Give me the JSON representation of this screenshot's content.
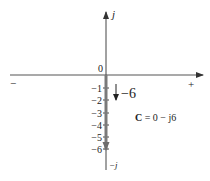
{
  "diagram": {
    "type": "complex-plane-phasor",
    "axes": {
      "real_negative_label": "−",
      "real_positive_label": "+",
      "imag_positive_label": "j",
      "imag_negative_label": "−j",
      "origin_label": "0"
    },
    "ticks": [
      {
        "label": "−1",
        "value": -1
      },
      {
        "label": "−2",
        "value": -2
      },
      {
        "label": "−3",
        "value": -3
      },
      {
        "label": "−4",
        "value": -4
      },
      {
        "label": "−5",
        "value": -5
      },
      {
        "label": "−6",
        "value": -6
      }
    ],
    "phasor": {
      "real": 0,
      "imag": -6,
      "magnitude_label": "−6",
      "equation_bold": "C",
      "equation_rest": " = 0 − j6"
    },
    "colors": {
      "axis": "#444444",
      "phasor": "#7a7a7a",
      "text": "#222222"
    }
  }
}
